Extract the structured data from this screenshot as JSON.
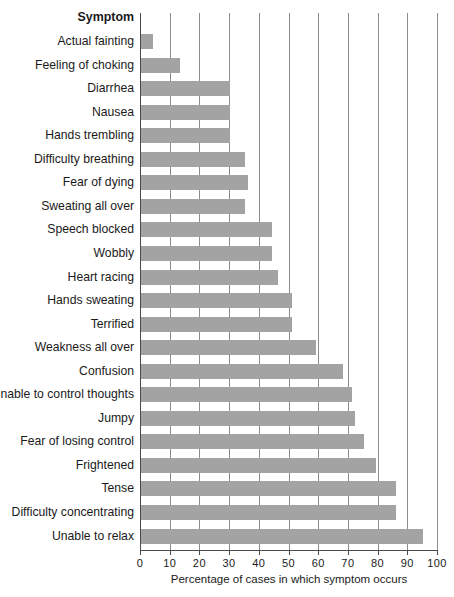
{
  "chart_data": {
    "type": "bar",
    "orientation": "horizontal",
    "title": "",
    "category_header": "Symptom",
    "xlabel": "Percentage of cases in which symptom occurs",
    "ylabel": "Symptom",
    "xlim": [
      0,
      100
    ],
    "xticks": [
      0,
      10,
      20,
      30,
      40,
      50,
      60,
      70,
      80,
      90,
      100
    ],
    "grid": "vertical",
    "legend": "none",
    "bar_color": "#a3a3a3",
    "categories": [
      "Actual fainting",
      "Feeling of choking",
      "Diarrhea",
      "Nausea",
      "Hands trembling",
      "Difficulty breathing",
      "Fear of dying",
      "Sweating all over",
      "Speech blocked",
      "Wobbly",
      "Heart racing",
      "Hands sweating",
      "Terrified",
      "Weakness all over",
      "Confusion",
      "Unable to control thoughts",
      "Jumpy",
      "Fear of losing control",
      "Frightened",
      "Tense",
      "Difficulty concentrating",
      "Unable to relax"
    ],
    "values": [
      4,
      13,
      30,
      30,
      30,
      35,
      36,
      35,
      44,
      44,
      46,
      51,
      51,
      59,
      68,
      71,
      72,
      75,
      79,
      86,
      86,
      95
    ]
  }
}
